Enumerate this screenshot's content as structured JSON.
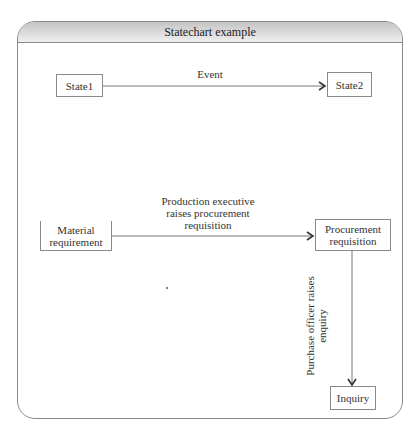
{
  "diagram": {
    "title": "Statechart example",
    "example": {
      "states": [
        {
          "label": "State1"
        },
        {
          "label": "State2"
        }
      ],
      "event": "Event"
    },
    "process": {
      "states": {
        "material": "Material requirement",
        "procurement": "Procurement requisition",
        "inquiry": "Inquiry"
      },
      "transitions": {
        "material_to_procurement": "Production executive raises procurement requisition",
        "procurement_to_inquiry": "Purchase officer raises enquiry"
      }
    }
  }
}
